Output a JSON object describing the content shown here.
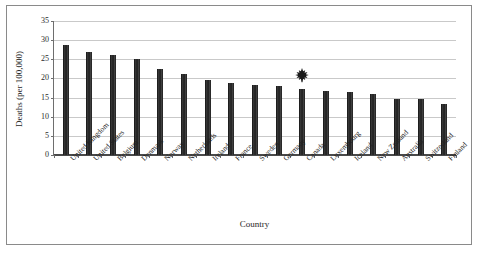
{
  "chart_data": {
    "type": "bar",
    "title": "",
    "xlabel": "Country",
    "ylabel": "Deaths (per 100,000)",
    "ylim": [
      0,
      35
    ],
    "ytick_step": 5,
    "yticks": [
      0,
      5,
      10,
      15,
      20,
      25,
      30,
      35
    ],
    "grid": true,
    "legend": "none",
    "bar_color": "#2a2a2a",
    "categories": [
      "United Kingdom",
      "United States",
      "Belgium",
      "Denmark",
      "Norway",
      "Netherlands",
      "Ireland",
      "France",
      "Sweden",
      "Germany",
      "Canada",
      "Luxembourg",
      "Iceland",
      "New Zealand",
      "Australia",
      "Switzerland",
      "Finland"
    ],
    "values": [
      28.8,
      26.8,
      26.2,
      25.1,
      22.4,
      21.2,
      19.6,
      18.9,
      18.3,
      17.9,
      17.2,
      16.7,
      16.4,
      15.9,
      14.7,
      14.6,
      13.3
    ],
    "annotations": [
      {
        "name": "canada-maple-leaf-marker",
        "icon": "maple-leaf-icon",
        "category": "Canada",
        "value": 17.2
      }
    ]
  }
}
